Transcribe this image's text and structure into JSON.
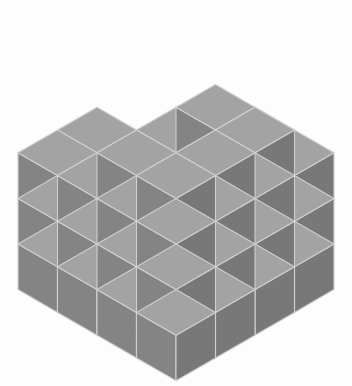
{
  "figure": {
    "title": "Isometric Cube Stack",
    "type": "isometric-voxel-illustration",
    "canvas": {
      "width": 352,
      "height": 386,
      "background": "#fdfdfd"
    }
  },
  "palette": {
    "background": "#fdfdfd",
    "top_face": "#a3a3a3",
    "left_face": "#848484",
    "right_face": "#787878",
    "edge_light": "#cfcfcf",
    "edge_top": "#bcbcbc",
    "outline": "#9a9a9a"
  },
  "projection": {
    "apex_x": 176,
    "apex_y": 16,
    "half_width": 39.5,
    "half_depth": 22.8,
    "cube_height": 45.6,
    "grid_size": 4,
    "max_height": 4
  },
  "structure": {
    "description": "4 by 4 base grid of stacked unit cubes with varying column heights forming a stepped pyramid with notches",
    "rows_label": "x index (front-left to back-right)",
    "cols_label": "y index (front-right to back-left)",
    "height_map": [
      [
        2,
        3,
        3,
        3
      ],
      [
        2,
        1,
        2,
        4
      ],
      [
        3,
        2,
        3,
        4
      ],
      [
        3,
        3,
        4,
        4
      ]
    ],
    "total_visible_columns": 16,
    "counts": {
      "height_1": 1,
      "height_2": 4,
      "height_3": 7,
      "height_4": 4
    }
  },
  "chart_data": {
    "type": "heatmap",
    "title": "Isometric Cube Stack",
    "xlabel": "x index",
    "ylabel": "y index",
    "categories_x": [
      "0",
      "1",
      "2",
      "3"
    ],
    "categories_y": [
      "0",
      "1",
      "2",
      "3"
    ],
    "values": [
      [
        2,
        3,
        3,
        3
      ],
      [
        2,
        1,
        2,
        4
      ],
      [
        3,
        2,
        3,
        4
      ],
      [
        3,
        3,
        4,
        4
      ]
    ],
    "zlim": [
      0,
      4
    ],
    "grid": false,
    "legend": "none"
  }
}
